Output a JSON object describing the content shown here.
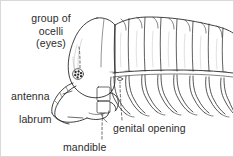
{
  "figure": {
    "background_color": "#ffffff",
    "ink_color": "#2b2b2b",
    "border_color": "#d9d9d9",
    "width": 234,
    "height": 157
  },
  "labels": {
    "ocelli_line1": "group of",
    "ocelli_line2": "ocelli",
    "ocelli_line3": "(eyes)",
    "antenna": "antenna",
    "labrum": "labrum",
    "mandible": "mandible",
    "genital_opening": "genital opening"
  },
  "anatomy": {
    "body_segments": 8,
    "leg_pairs": 8,
    "ocelli_count": 7
  }
}
